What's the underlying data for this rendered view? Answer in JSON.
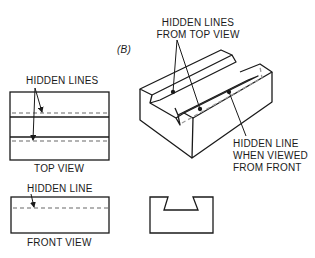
{
  "figure": {
    "panel_label": "(B)",
    "labels": {
      "top_view_hidden": "HIDDEN LINES",
      "top_view_caption": "TOP VIEW",
      "front_view_hidden": "HIDDEN LINE",
      "front_view_caption": "FRONT VIEW",
      "iso_top_line1": "HIDDEN LINES",
      "iso_top_line2": "FROM TOP VIEW",
      "iso_front_line1": "HIDDEN LINE",
      "iso_front_line2": "WHEN VIEWED",
      "iso_front_line3": "FROM FRONT"
    },
    "colors": {
      "line": "#1a1a1a",
      "hidden_line": "#9a9a9a",
      "background": "#ffffff"
    }
  }
}
